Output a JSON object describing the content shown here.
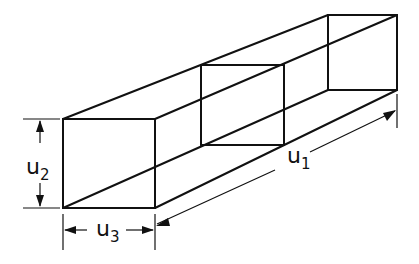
{
  "diagram": {
    "type": "isometric rectangular duct / prism with dimensions",
    "labels": {
      "u1": {
        "base": "u",
        "sub": "1"
      },
      "u2": {
        "base": "u",
        "sub": "2"
      },
      "u3": {
        "base": "u",
        "sub": "3"
      }
    },
    "dimensions": [
      {
        "name": "u1",
        "description": "length along the prism axis"
      },
      {
        "name": "u2",
        "description": "height of front face"
      },
      {
        "name": "u3",
        "description": "width of front face"
      }
    ],
    "cross_sections": [
      "front-face",
      "middle-section",
      "back-face"
    ]
  }
}
